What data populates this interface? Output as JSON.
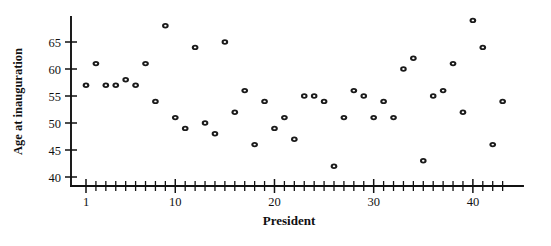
{
  "chart": {
    "title": "",
    "type_label": "scatter-plot"
  },
  "chart_data": {
    "type": "scatter",
    "title": "",
    "subtitle": "",
    "xlabel": "President",
    "ylabel": "Age at inauguration",
    "xlim": [
      0,
      44
    ],
    "ylim": [
      38,
      70
    ],
    "grid": false,
    "legend": null,
    "x_ticks_major": [
      1,
      10,
      20,
      30,
      40
    ],
    "x_tick_labels": [
      "1",
      "10",
      "20",
      "30",
      "40"
    ],
    "x_ticks_minor_step": 1,
    "x_minor_range": [
      1,
      43
    ],
    "y_ticks_major": [
      40,
      45,
      50,
      55,
      60,
      65
    ],
    "y_tick_labels": [
      "40",
      "45",
      "50",
      "55",
      "60",
      "65"
    ],
    "marker_style": "open-circle",
    "marker_color": "#1a1a1a",
    "x": [
      1,
      2,
      3,
      4,
      5,
      6,
      7,
      8,
      9,
      10,
      11,
      12,
      13,
      14,
      15,
      16,
      17,
      18,
      19,
      20,
      21,
      22,
      23,
      24,
      25,
      26,
      27,
      28,
      29,
      30,
      31,
      32,
      33,
      34,
      35,
      36,
      37,
      38,
      39,
      40,
      41,
      42,
      43
    ],
    "y": [
      57,
      61,
      57,
      57,
      58,
      57,
      61,
      54,
      68,
      51,
      49,
      64,
      50,
      48,
      65,
      52,
      56,
      46,
      54,
      49,
      51,
      47,
      55,
      55,
      54,
      42,
      51,
      56,
      55,
      51,
      54,
      51,
      60,
      62,
      43,
      55,
      56,
      61,
      52,
      69,
      64,
      46,
      54
    ],
    "values": [
      {
        "president": 1,
        "age": 57
      },
      {
        "president": 2,
        "age": 61
      },
      {
        "president": 3,
        "age": 57
      },
      {
        "president": 4,
        "age": 57
      },
      {
        "president": 5,
        "age": 58
      },
      {
        "president": 6,
        "age": 57
      },
      {
        "president": 7,
        "age": 61
      },
      {
        "president": 8,
        "age": 54
      },
      {
        "president": 9,
        "age": 68
      },
      {
        "president": 10,
        "age": 51
      },
      {
        "president": 11,
        "age": 49
      },
      {
        "president": 12,
        "age": 64
      },
      {
        "president": 13,
        "age": 50
      },
      {
        "president": 14,
        "age": 48
      },
      {
        "president": 15,
        "age": 65
      },
      {
        "president": 16,
        "age": 52
      },
      {
        "president": 17,
        "age": 56
      },
      {
        "president": 18,
        "age": 46
      },
      {
        "president": 19,
        "age": 54
      },
      {
        "president": 20,
        "age": 49
      },
      {
        "president": 21,
        "age": 51
      },
      {
        "president": 22,
        "age": 47
      },
      {
        "president": 23,
        "age": 55
      },
      {
        "president": 24,
        "age": 55
      },
      {
        "president": 25,
        "age": 54
      },
      {
        "president": 26,
        "age": 42
      },
      {
        "president": 27,
        "age": 51
      },
      {
        "president": 28,
        "age": 56
      },
      {
        "president": 29,
        "age": 55
      },
      {
        "president": 30,
        "age": 51
      },
      {
        "president": 31,
        "age": 54
      },
      {
        "president": 32,
        "age": 51
      },
      {
        "president": 33,
        "age": 60
      },
      {
        "president": 34,
        "age": 62
      },
      {
        "president": 35,
        "age": 43
      },
      {
        "president": 36,
        "age": 55
      },
      {
        "president": 37,
        "age": 56
      },
      {
        "president": 38,
        "age": 61
      },
      {
        "president": 39,
        "age": 52
      },
      {
        "president": 40,
        "age": 69
      },
      {
        "president": 41,
        "age": 64
      },
      {
        "president": 42,
        "age": 46
      },
      {
        "president": 43,
        "age": 54
      }
    ]
  }
}
